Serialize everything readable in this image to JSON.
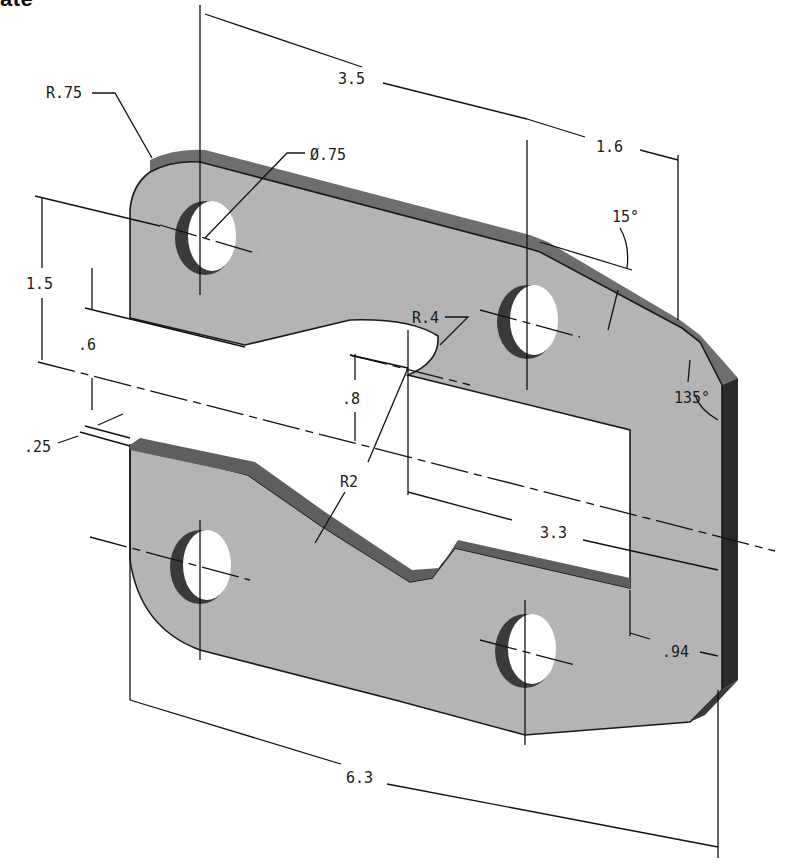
{
  "heading": {
    "visible_fragment": "ate"
  },
  "drawing": {
    "type": "isometric-dimensioned-plate",
    "colors": {
      "face": "#b4b4b4",
      "edge_top": "#6e6e6e",
      "edge_side": "#2a2a2a",
      "hole_shadow": "#3a3a3a",
      "hole_inner": "#7a7a7a",
      "line": "#111111",
      "background": "#ffffff"
    },
    "dimensions": {
      "corner_radius": "R.75",
      "hole_diameter": "Ø.75",
      "hole_spacing_x": "3.5",
      "hole_to_edge_x": "1.6",
      "chamfer_angle": "15°",
      "corner_angle": "135°",
      "hole_spacing_y": "1.5",
      "slot_offset": ".6",
      "slot_gap": ".25",
      "notch_radius": "R.4",
      "notch_center_offset": ".8",
      "arc_radius": "R2",
      "slot_length": "3.3",
      "slot_end_offset": ".94",
      "overall_length": "6.3"
    }
  }
}
